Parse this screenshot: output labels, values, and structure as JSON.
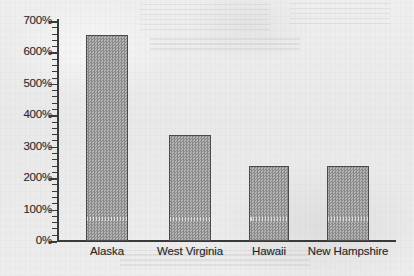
{
  "chart_data": {
    "type": "bar",
    "title": "",
    "subtitle": "",
    "xlabel": "",
    "ylabel": "",
    "categories": [
      "Alaska",
      "West Virginia",
      "Hawaii",
      "New Hampshire"
    ],
    "values": [
      655,
      337,
      239,
      238
    ],
    "value_labels": [
      "655%",
      "337%",
      "239%",
      "238%"
    ],
    "ylim": [
      0,
      700
    ],
    "y_tick_step": 100,
    "y_minor_tick_step": 20,
    "y_tick_labels": [
      "0%",
      "100%",
      "200%",
      "300%",
      "400%",
      "500%",
      "600%",
      "700%"
    ],
    "y_tick_values": [
      0,
      100,
      200,
      300,
      400,
      500,
      600,
      700
    ],
    "grid": false,
    "legend": false,
    "legend_position": "none",
    "units": "percent",
    "series": [
      {
        "name": "",
        "values": [
          655,
          337,
          239,
          238
        ]
      }
    ],
    "annotations": [],
    "style": {
      "bar_fill": "#9a9a9a",
      "bar_fill_pattern": "checkerboard-dither-50",
      "bar_outline": "#4a4a4a",
      "axis_color": "#3a3a3a",
      "text_color": "#262626",
      "background": "#ececec",
      "media": "scanned-paper"
    }
  },
  "axis": {
    "y_labels": [
      {
        "text": "700%",
        "value": 700
      },
      {
        "text": "600%",
        "value": 600
      },
      {
        "text": "500%",
        "value": 500
      },
      {
        "text": "400%",
        "value": 400
      },
      {
        "text": "300%",
        "value": 300
      },
      {
        "text": "200%",
        "value": 200
      },
      {
        "text": "100%",
        "value": 100
      },
      {
        "text": "0%",
        "value": 0
      }
    ]
  },
  "bars": [
    {
      "label": "Alaska",
      "value": 655
    },
    {
      "label": "West Virginia",
      "value": 337
    },
    {
      "label": "Hawaii",
      "value": 239
    },
    {
      "label": "New Hampshire",
      "value": 238
    }
  ]
}
